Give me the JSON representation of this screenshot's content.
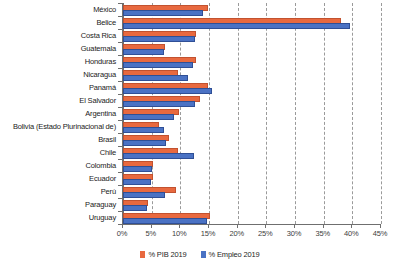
{
  "chart_data": {
    "type": "bar",
    "orientation": "horizontal",
    "title": "",
    "subtitle": "",
    "xlabel": "",
    "ylabel": "",
    "xlim": [
      0,
      45
    ],
    "xticks": [
      0,
      5,
      10,
      15,
      20,
      25,
      30,
      35,
      40,
      45
    ],
    "xtick_labels": [
      "0%",
      "5%",
      "10%",
      "15%",
      "20%",
      "25%",
      "30%",
      "35%",
      "40%",
      "45%"
    ],
    "grid": true,
    "legend_position": "bottom",
    "colors": {
      "pib": "#e8693f",
      "empleo": "#4a72c4"
    },
    "categories": [
      "México",
      "Belice",
      "Costa Rica",
      "Guatemala",
      "Honduras",
      "Nicaragua",
      "Panamá",
      "El Salvador",
      "Argentina",
      "Bolivia (Estado Plurinacional de)",
      "Brasil",
      "Chile",
      "Colombia",
      "Ecuador",
      "Perú",
      "Paraguay",
      "Uruguay"
    ],
    "series": [
      {
        "name": "% PIB 2019",
        "color": "#e8693f",
        "values": [
          14.5,
          37.7,
          12.4,
          7.0,
          12.3,
          9.3,
          14.5,
          13.0,
          9.4,
          6.0,
          7.7,
          9.3,
          4.9,
          4.9,
          8.9,
          4.0,
          14.8
        ]
      },
      {
        "name": "% Empleo 2019",
        "color": "#4a72c4",
        "values": [
          13.6,
          39.3,
          12.2,
          6.8,
          11.9,
          11.0,
          15.2,
          12.2,
          8.6,
          6.8,
          7.2,
          12.0,
          4.7,
          4.5,
          7.0,
          3.8,
          14.3
        ]
      }
    ]
  },
  "legend": {
    "items": [
      {
        "label": "% PIB 2019",
        "key": "pib"
      },
      {
        "label": "% Empleo 2019",
        "key": "empleo"
      }
    ]
  }
}
